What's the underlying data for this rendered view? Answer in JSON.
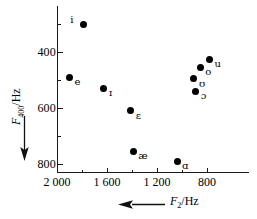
{
  "chart_data": {
    "type": "scatter",
    "title": "",
    "xlabel": "F2/Hz",
    "ylabel": "F1/Hz",
    "xlabel_italic": "F",
    "xlabel_sub": "2",
    "xlabel_unit": "/Hz",
    "ylabel_italic": "F",
    "ylabel_sub": "1",
    "ylabel_unit": "/Hz",
    "x_axis": {
      "label": "F2/Hz",
      "reversed": true,
      "min": 2000,
      "max": 700,
      "major_ticks": [
        2000,
        1600,
        1200,
        800
      ],
      "major_tick_labels": [
        "2 000",
        "1 600",
        "1 200",
        "800"
      ],
      "minor_ticks": [
        1800,
        1400,
        1000
      ],
      "arrow_direction": "left"
    },
    "y_axis": {
      "label": "F1/Hz",
      "reversed": true,
      "min": 250,
      "max": 850,
      "major_ticks": [
        400,
        600,
        800
      ],
      "major_tick_labels": [
        "400",
        "600",
        "800"
      ],
      "minor_ticks": [
        300,
        500,
        700
      ],
      "arrow_direction": "down"
    },
    "grid": false,
    "legend": false,
    "marker_color": "#000000",
    "points": [
      {
        "label": "i",
        "f2": 1790,
        "f1": 300,
        "label_side": "left"
      },
      {
        "label": "e",
        "f2": 1900,
        "f1": 490,
        "label_side": "right"
      },
      {
        "label": "ɪ",
        "f2": 1625,
        "f1": 530,
        "label_side": "right"
      },
      {
        "label": "ɛ",
        "f2": 1410,
        "f1": 610,
        "label_side": "right"
      },
      {
        "label": "æ",
        "f2": 1390,
        "f1": 755,
        "label_side": "right"
      },
      {
        "label": "ɑ",
        "f2": 1040,
        "f1": 790,
        "label_side": "right"
      },
      {
        "label": "u",
        "f2": 780,
        "f1": 425,
        "label_side": "right"
      },
      {
        "label": "o",
        "f2": 855,
        "f1": 455,
        "label_side": "right"
      },
      {
        "label": "ʊ",
        "f2": 905,
        "f1": 495,
        "label_side": "right"
      },
      {
        "label": "ɔ",
        "f2": 890,
        "f1": 540,
        "label_side": "right"
      }
    ]
  }
}
